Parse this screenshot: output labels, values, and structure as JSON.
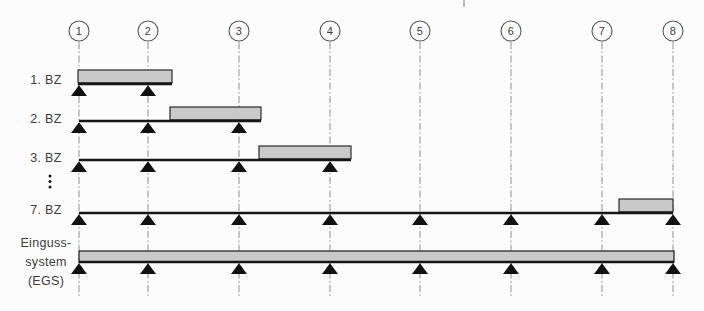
{
  "figure": {
    "width": 704,
    "height": 311,
    "background": "#fcfcfc",
    "axes": {
      "labels": [
        "1",
        "2",
        "3",
        "4",
        "5",
        "6",
        "7",
        "8"
      ],
      "x": [
        79,
        148,
        239,
        330,
        420,
        511,
        602,
        673
      ],
      "circle_cy": 31,
      "circle_r": 10,
      "line_top": 42,
      "line_bottom": 297
    },
    "label_column_x": 46,
    "rows": [
      {
        "type": "stage",
        "label": "1. BZ",
        "label_y": 80,
        "beam_y": 84,
        "beam_x1": 78,
        "beam_x2": 172,
        "segment_x1": 78,
        "segment_x2": 172,
        "support_axes": [
          0,
          1
        ]
      },
      {
        "type": "stage",
        "label": "2. BZ",
        "label_y": 119,
        "beam_y": 121,
        "beam_x1": 79,
        "beam_x2": 261,
        "segment_x1": 170,
        "segment_x2": 261,
        "support_axes": [
          0,
          1,
          2
        ]
      },
      {
        "type": "stage",
        "label": "3. BZ",
        "label_y": 158,
        "beam_y": 160,
        "beam_x1": 79,
        "beam_x2": 351,
        "segment_x1": 259,
        "segment_x2": 351,
        "support_axes": [
          0,
          1,
          2,
          3
        ]
      },
      {
        "type": "stage",
        "label": "7. BZ",
        "label_y": 210,
        "beam_y": 213,
        "beam_x1": 79,
        "beam_x2": 673,
        "segment_x1": 619,
        "segment_x2": 673,
        "support_axes": [
          0,
          1,
          2,
          3,
          4,
          5,
          6,
          7
        ]
      },
      {
        "type": "slab",
        "label_lines": [
          "Einguss-",
          "system",
          "(EGS)"
        ],
        "label_y": 243,
        "label_line_height": 19,
        "slab_top": 251,
        "beam_y": 262,
        "slab_x1": 79,
        "slab_x2": 674,
        "support_axes": [
          0,
          1,
          2,
          3,
          4,
          5,
          6,
          7
        ]
      }
    ],
    "ellipsis": {
      "x": 50,
      "dot_ys": [
        176,
        181.5,
        187
      ],
      "dot_r": 1.5
    },
    "artifact_tick": {
      "x": 464,
      "y1": 0,
      "y2": 7
    },
    "geometry": {
      "segment_offset": 14,
      "segment_height": 12.8,
      "beam_stroke": 2.4,
      "support_half_width": 8,
      "support_height": 11,
      "label_font_size": 12.5,
      "axis_font_size": 11
    },
    "colors": {
      "segment_fill": "#c9c9c9",
      "segment_stroke": "#2a2a2a",
      "beam": "#161616",
      "support": "#111111",
      "axis_line": "#8f8f8f",
      "circle_stroke": "#5a5a5a",
      "circle_fill": "#fdfdfd",
      "text": "#3c3c3c"
    }
  }
}
